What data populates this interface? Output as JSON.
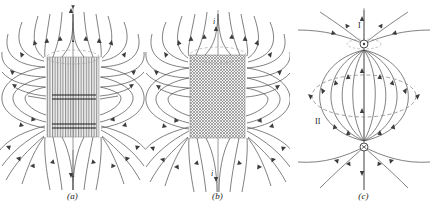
{
  "figure": {
    "background_color": "#ffffff",
    "line_color": "#4a4a4a",
    "core_color": "#8a8a8a",
    "text_color": "#1a1a1a",
    "panel_count": 3
  },
  "panels": [
    {
      "id": "a",
      "caption": "(a)",
      "core_label": "",
      "core_texture": "vertical-hatch",
      "description": "Solenoid cross-section with closely spaced vertical field lines inside the core and looping external field lines"
    },
    {
      "id": "b",
      "caption": "(b)",
      "core_texture": "cross-hatch-dots",
      "current_label_top": "i",
      "current_label_bottom": "i",
      "description": "Solenoid with current i entering at top and leaving at bottom, dense dotted winding texture inside the core"
    },
    {
      "id": "c",
      "caption": "(c)",
      "pole_label": "I",
      "loop_label": "II",
      "description": "Magnetic dipole field of a current loop showing pole point I and dashed equatorial circle II"
    }
  ]
}
